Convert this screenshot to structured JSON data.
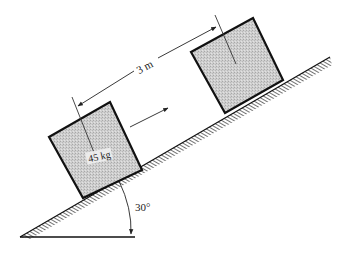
{
  "diagram": {
    "type": "inclined-plane",
    "incline_angle_label": "30°",
    "distance_label": "3 m",
    "mass_label": "45 kg",
    "colors": {
      "line": "#111111",
      "box_fill": "#c9c9c9",
      "hatch": "#333333",
      "background": "#ffffff"
    },
    "blocks": [
      {
        "id": "block-lower",
        "label": "45 kg"
      },
      {
        "id": "block-upper",
        "label": ""
      }
    ]
  }
}
